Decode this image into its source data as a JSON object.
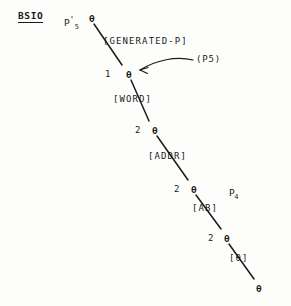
{
  "figure": {
    "title_tag": "BSIO",
    "root_symbol": {
      "base": "P",
      "prime": "'",
      "subscript": "5"
    },
    "node_glyph": "θ",
    "colors": {
      "ink": "#1a1a18",
      "paper": "#fdfdfc"
    }
  },
  "nodes": [
    {
      "id": "n0",
      "glyph": "θ",
      "x": 89,
      "y": 14
    },
    {
      "id": "n1",
      "glyph": "θ",
      "x": 126,
      "y": 70
    },
    {
      "id": "n2",
      "glyph": "θ",
      "x": 152,
      "y": 126
    },
    {
      "id": "n3",
      "glyph": "θ",
      "x": 191,
      "y": 185
    },
    {
      "id": "n4",
      "glyph": "θ",
      "x": 224,
      "y": 234
    },
    {
      "id": "n5",
      "glyph": "θ",
      "x": 256,
      "y": 284
    }
  ],
  "arc_numbers": [
    {
      "label": "1",
      "x": 105,
      "y": 70
    },
    {
      "label": "2",
      "x": 135,
      "y": 126
    },
    {
      "label": "2",
      "x": 174,
      "y": 185
    },
    {
      "label": "2",
      "x": 208,
      "y": 234
    }
  ],
  "category_labels": [
    {
      "text": "[GENERATED-P]",
      "x": 103,
      "y": 37
    },
    {
      "text": "[WORD]",
      "x": 113,
      "y": 95
    },
    {
      "text": "[ADDR]",
      "x": 148,
      "y": 152
    },
    {
      "text": "[AB]",
      "x": 192,
      "y": 204
    },
    {
      "text": "[θ]",
      "x": 229,
      "y": 254
    }
  ],
  "annotations": [
    {
      "text": "(P",
      "subscript": "5",
      "close": ")",
      "x": 196,
      "y": 57
    }
  ],
  "side_symbols": [
    {
      "base": "P",
      "subscript": "4",
      "x": 204,
      "y": 182
    }
  ],
  "edges": [
    {
      "from": "n0",
      "to": "n1",
      "x1": 94,
      "y1": 24,
      "x2": 122,
      "y2": 65
    },
    {
      "from": "n1",
      "to": "n2",
      "x1": 131,
      "y1": 80,
      "x2": 149,
      "y2": 121
    },
    {
      "from": "n2",
      "to": "n3",
      "x1": 157,
      "y1": 136,
      "x2": 188,
      "y2": 180
    },
    {
      "from": "n3",
      "to": "n4",
      "x1": 196,
      "y1": 195,
      "x2": 221,
      "y2": 229
    },
    {
      "from": "n4",
      "to": "n5",
      "x1": 229,
      "y1": 244,
      "x2": 254,
      "y2": 279
    }
  ],
  "curved_arrow": {
    "description": "curved arrow from (P5) annotation to node n1",
    "path": "M 193 60 C 175 57, 155 61, 139 70",
    "arrowhead_at": {
      "x": 136,
      "y": 71
    }
  }
}
